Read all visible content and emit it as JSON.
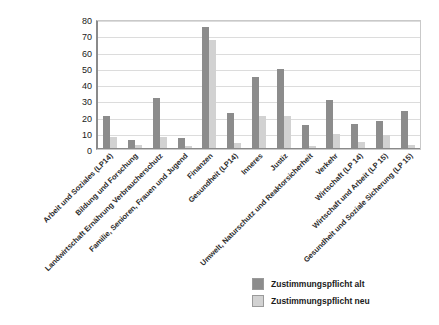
{
  "chart_data": {
    "type": "bar",
    "title": "",
    "subtitle": "",
    "xlabel": "",
    "ylabel": "",
    "ylim": [
      0,
      80
    ],
    "yticks": [
      0,
      10,
      20,
      30,
      40,
      50,
      60,
      70,
      80
    ],
    "grid": true,
    "legend_position": "bottom-right",
    "orientation": "vertical",
    "grouping": "grouped",
    "categories": [
      "Arbeit und Soziales (LP14)",
      "Bildung und Forschung",
      "Landwirtschaft Ernährung Verbraucherschutz",
      "Familie, Senioren, Frauen und Jugend",
      "Finanzen",
      "Gesundheit (LP14)",
      "Inneres",
      "Justiz",
      "Umwelt, Naturschutz und Reaktorsicherheit",
      "Verkehr",
      "Wirtschaft (LP 14)",
      "Wirtschaft und Arbeit (LP 15)",
      "Gesundheit und Soziale Sicherung (LP 15)"
    ],
    "series": [
      {
        "name": "Zustimmungspflicht alt",
        "color": "#8c8c8c",
        "values": [
          20,
          5,
          31,
          6,
          75,
          22,
          44,
          49,
          14,
          30,
          15,
          17,
          23
        ]
      },
      {
        "name": "Zustimmungspflicht neu",
        "color": "#d2d2d2",
        "values": [
          7,
          2,
          7,
          1,
          67,
          3,
          20,
          20,
          1,
          9,
          4,
          8,
          2
        ]
      }
    ]
  },
  "legend": {
    "items": [
      {
        "label": "Zustimmungspflicht alt",
        "color": "#8c8c8c"
      },
      {
        "label": "Zustimmungspflicht neu",
        "color": "#d2d2d2"
      }
    ]
  },
  "colors": {
    "series_alt": "#8c8c8c",
    "series_neu": "#d2d2d2",
    "gridline": "#dcdcdc",
    "axis": "#8a8a8a",
    "background": "#ffffff",
    "text": "#1a1a1a"
  }
}
